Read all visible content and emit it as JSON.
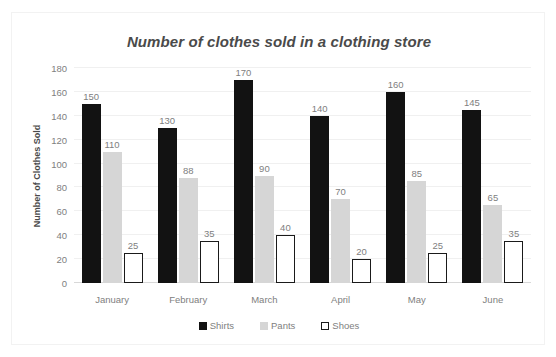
{
  "chart_data": {
    "type": "bar",
    "title": "Number of clothes sold in a clothing store",
    "xlabel": "",
    "ylabel": "Number of Clothes Sold",
    "categories": [
      "January",
      "February",
      "March",
      "April",
      "May",
      "June"
    ],
    "series": [
      {
        "name": "Shirts",
        "color": "#121212",
        "values": [
          150,
          130,
          170,
          140,
          160,
          145
        ]
      },
      {
        "name": "Pants",
        "color": "#d6d6d6",
        "values": [
          110,
          88,
          90,
          70,
          85,
          65
        ]
      },
      {
        "name": "Shoes",
        "color": "#ffffff",
        "values": [
          25,
          35,
          40,
          20,
          25,
          35
        ]
      }
    ],
    "ylim": [
      0,
      180
    ],
    "yticks": [
      0,
      20,
      40,
      60,
      80,
      100,
      120,
      140,
      160,
      180
    ],
    "ytick_labels": [
      "0",
      "20",
      "40",
      "60",
      "80",
      "100",
      "120",
      "140",
      "160",
      "180"
    ],
    "grid": true,
    "data_labels": true,
    "legend_position": "bottom"
  },
  "colors": {
    "title_text": "#4a4a4a",
    "tick_text": "#808080",
    "gridline": "#f0f0f0",
    "axis": "#d8d8d8",
    "shirts": "#121212",
    "pants": "#d6d6d6",
    "shoes": "#ffffff",
    "shoes_border": "#1a1a1a"
  }
}
